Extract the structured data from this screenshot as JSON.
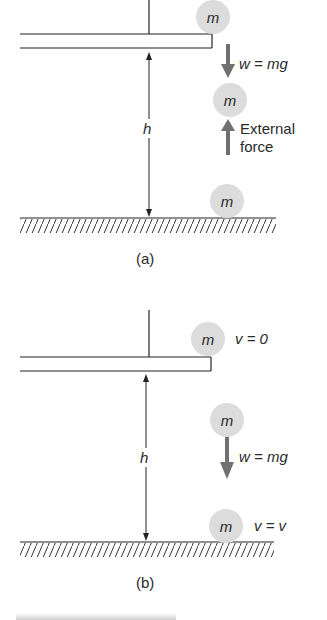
{
  "panel_a": {
    "caption": "(a)",
    "mass_top": "m",
    "mass_middle": "m",
    "mass_bottom": "m",
    "weight_label": "w = mg",
    "height_label": "h",
    "external_force_label_line1": "External",
    "external_force_label_line2": "force"
  },
  "panel_b": {
    "caption": "(b)",
    "mass_top": "m",
    "mass_middle": "m",
    "mass_bottom": "m",
    "velocity_top_label": "v = 0",
    "weight_label": "w = mg",
    "height_label": "h",
    "velocity_bottom_label": "v = v"
  },
  "colors": {
    "ball_fill": "#dcdcdc",
    "arrow_gray": "#707070",
    "line": "#222222"
  }
}
